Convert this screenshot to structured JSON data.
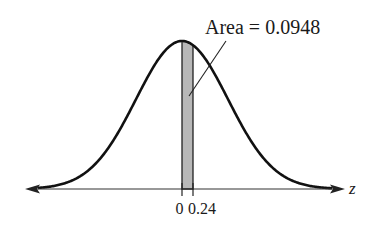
{
  "chart_data": {
    "type": "area",
    "title": "",
    "xlabel": "z",
    "ylabel": "",
    "distribution": "standard normal",
    "shaded_region": {
      "from": 0,
      "to": 0.24
    },
    "annotation": "Area = 0.0948",
    "tick_labels": [
      "0",
      "0.24"
    ],
    "grid": false,
    "legend": "none"
  },
  "labels": {
    "annotation": "Area = 0.0948",
    "tick_zero": "0",
    "tick_024": "0.24",
    "axis": "z"
  },
  "colors": {
    "shade": "#b8b8b8",
    "curve": "#111111"
  }
}
